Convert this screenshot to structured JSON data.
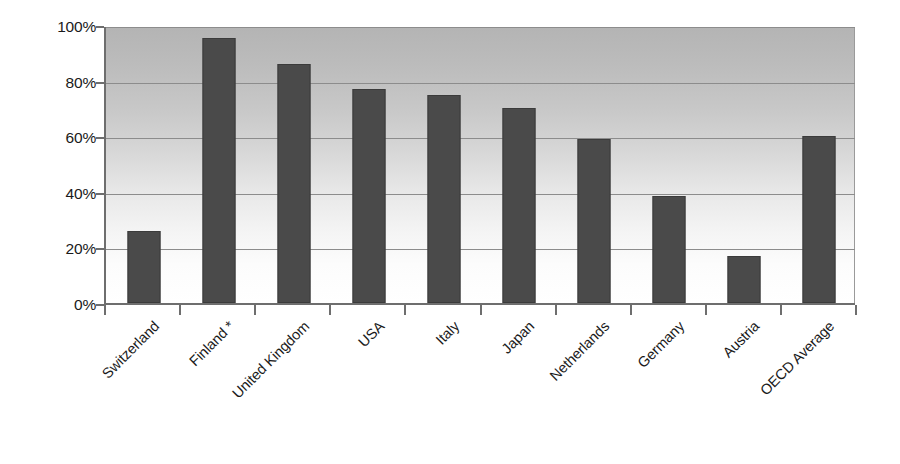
{
  "chart_data": {
    "type": "bar",
    "title": "",
    "subtitle": "",
    "xlabel": "",
    "ylabel": "",
    "ylim": [
      0,
      100
    ],
    "y_unit": "%",
    "grid": true,
    "legend": "none",
    "orientation": "vertical",
    "categories": [
      "Switzerland",
      "Finland *",
      "United Kingdom",
      "USA",
      "Italy",
      "Japan",
      "Netherlands",
      "Germany",
      "Austria",
      "OECD Average"
    ],
    "values": [
      26,
      95.5,
      86,
      77,
      75,
      70,
      59,
      38.5,
      17,
      60
    ],
    "y_ticks": [
      0,
      20,
      40,
      60,
      80,
      100
    ],
    "y_tick_labels": [
      "0%",
      "20%",
      "40%",
      "60%",
      "80%",
      "100%"
    ],
    "annotations": [
      "* asterisk appended to Finland label"
    ]
  },
  "style": {
    "bar_color": "#4a4a4a",
    "bar_border_color": "#3b3b3b",
    "gridline_color": "#8c8c8c",
    "axis_color": "#6e6e6e",
    "text_color": "#1a1a1a",
    "plot_bg_top": "#b4b4b4",
    "plot_bg_bottom": "#ffffff",
    "page_bg": "#ffffff"
  }
}
